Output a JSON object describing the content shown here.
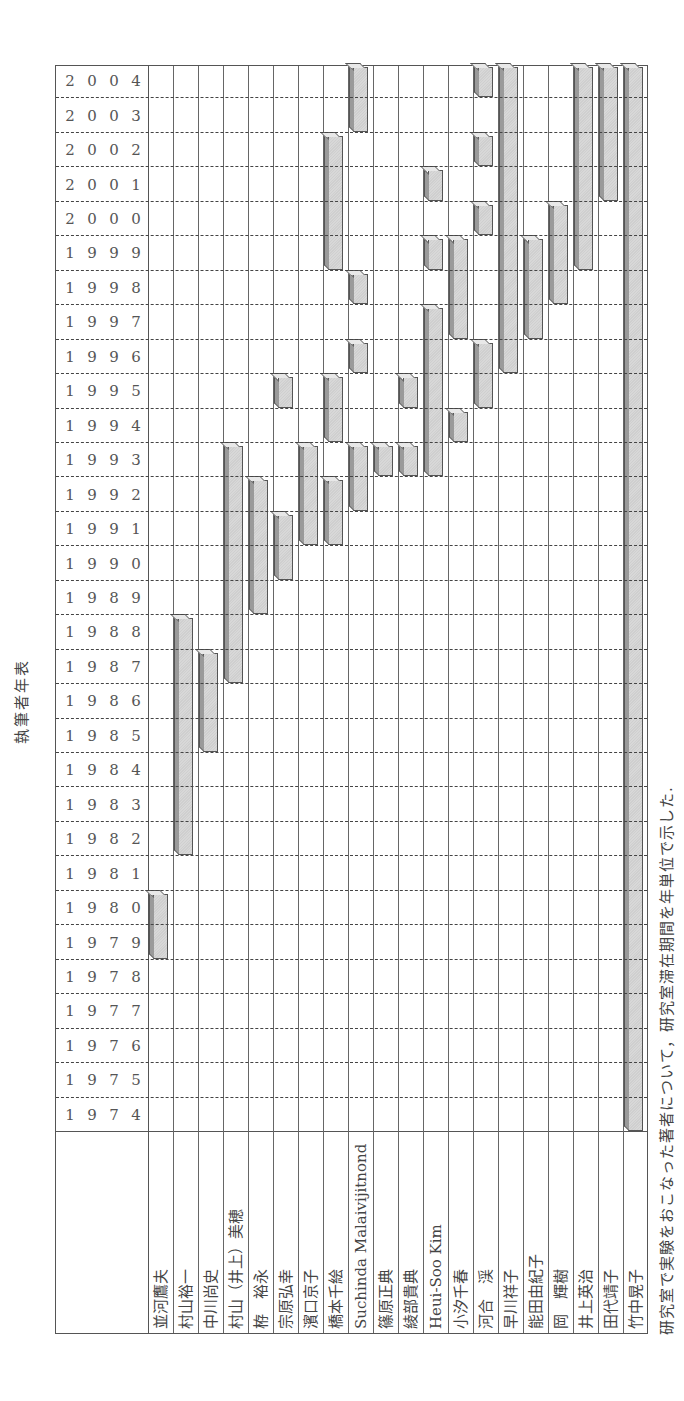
{
  "title": "執筆者年表",
  "caption": "研究室で実験をおこなった著者について，研究室滞在期間を年単位で示した.",
  "chart_data": {
    "type": "table",
    "title": "執筆者年表",
    "xlabel": "年",
    "ylabel": "執筆者",
    "year_range": [
      1974,
      2004
    ],
    "years": [
      1974,
      1975,
      1976,
      1977,
      1978,
      1979,
      1980,
      1981,
      1982,
      1983,
      1984,
      1985,
      1986,
      1987,
      1988,
      1989,
      1990,
      1991,
      1992,
      1993,
      1994,
      1995,
      1996,
      1997,
      1998,
      1999,
      2000,
      2001,
      2002,
      2003,
      2004
    ],
    "authors": [
      {
        "name": "並河鷹夫",
        "periods": [
          [
            1979,
            1980
          ]
        ]
      },
      {
        "name": "村山裕一",
        "periods": [
          [
            1982,
            1988
          ]
        ]
      },
      {
        "name": "中川尚史",
        "periods": [
          [
            1985,
            1987
          ]
        ]
      },
      {
        "name": "村山（井上）美穂",
        "periods": [
          [
            1987,
            1993
          ]
        ]
      },
      {
        "name": "栫　裕永",
        "periods": [
          [
            1989,
            1992
          ]
        ]
      },
      {
        "name": "宗原弘幸",
        "periods": [
          [
            1990,
            1991
          ],
          [
            1995,
            1995
          ]
        ]
      },
      {
        "name": "濱口京子",
        "periods": [
          [
            1991,
            1993
          ]
        ]
      },
      {
        "name": "橋本千絵",
        "periods": [
          [
            1991,
            1992
          ],
          [
            1994,
            1995
          ],
          [
            1999,
            2002
          ]
        ]
      },
      {
        "name": "Suchinda Malaivijitnond",
        "periods": [
          [
            1992,
            1993
          ],
          [
            1996,
            1996
          ],
          [
            1998,
            1998
          ],
          [
            2003,
            2004
          ]
        ]
      },
      {
        "name": "篠原正典",
        "periods": [
          [
            1993,
            1993
          ]
        ]
      },
      {
        "name": "綾部貴典",
        "periods": [
          [
            1993,
            1993
          ],
          [
            1995,
            1995
          ]
        ]
      },
      {
        "name": "Heui-Soo Kim",
        "periods": [
          [
            1993,
            1997
          ],
          [
            1999,
            1999
          ],
          [
            2001,
            2001
          ]
        ]
      },
      {
        "name": "小汐千春",
        "periods": [
          [
            1994,
            1994
          ],
          [
            1997,
            1999
          ]
        ]
      },
      {
        "name": "河合　渓",
        "periods": [
          [
            1995,
            1996
          ],
          [
            2000,
            2000
          ],
          [
            2002,
            2002
          ],
          [
            2004,
            2004
          ]
        ]
      },
      {
        "name": "早川祥子",
        "periods": [
          [
            1996,
            2004
          ]
        ]
      },
      {
        "name": "能田由紀子",
        "periods": [
          [
            1997,
            1999
          ]
        ]
      },
      {
        "name": "岡　輝樹",
        "periods": [
          [
            1998,
            2000
          ]
        ]
      },
      {
        "name": "井上英治",
        "periods": [
          [
            1999,
            2004
          ]
        ]
      },
      {
        "name": "田代靖子",
        "periods": [
          [
            2001,
            2004
          ]
        ]
      },
      {
        "name": "竹中晃子",
        "periods": [
          [
            1974,
            2004
          ]
        ]
      }
    ],
    "grid": true,
    "bar_color": "#d4d4d4",
    "border_color": "#555555"
  }
}
